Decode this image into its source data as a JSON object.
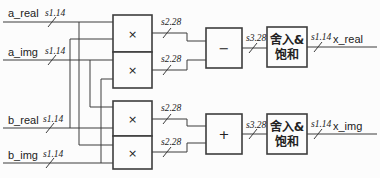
{
  "colors": {
    "line": "#3d3d3d",
    "text": "#222222",
    "background": "#fcfcfc"
  },
  "inputs": [
    {
      "name": "a_real",
      "width": "s1.14"
    },
    {
      "name": "a_img",
      "width": "s1.14"
    },
    {
      "name": "b_real",
      "width": "s1.14"
    },
    {
      "name": "b_img",
      "width": "s1.14"
    }
  ],
  "outputs": [
    {
      "name": "x_real",
      "width": "s1.14"
    },
    {
      "name": "x_img",
      "width": "s1.14"
    }
  ],
  "buses": {
    "mult_out": "s2.28",
    "sum_out": "s3.28"
  },
  "blocks": {
    "multiply": "×",
    "subtract": "−",
    "add": "+",
    "round_saturate_line1": "舍入&",
    "round_saturate_line2": "饱和"
  }
}
